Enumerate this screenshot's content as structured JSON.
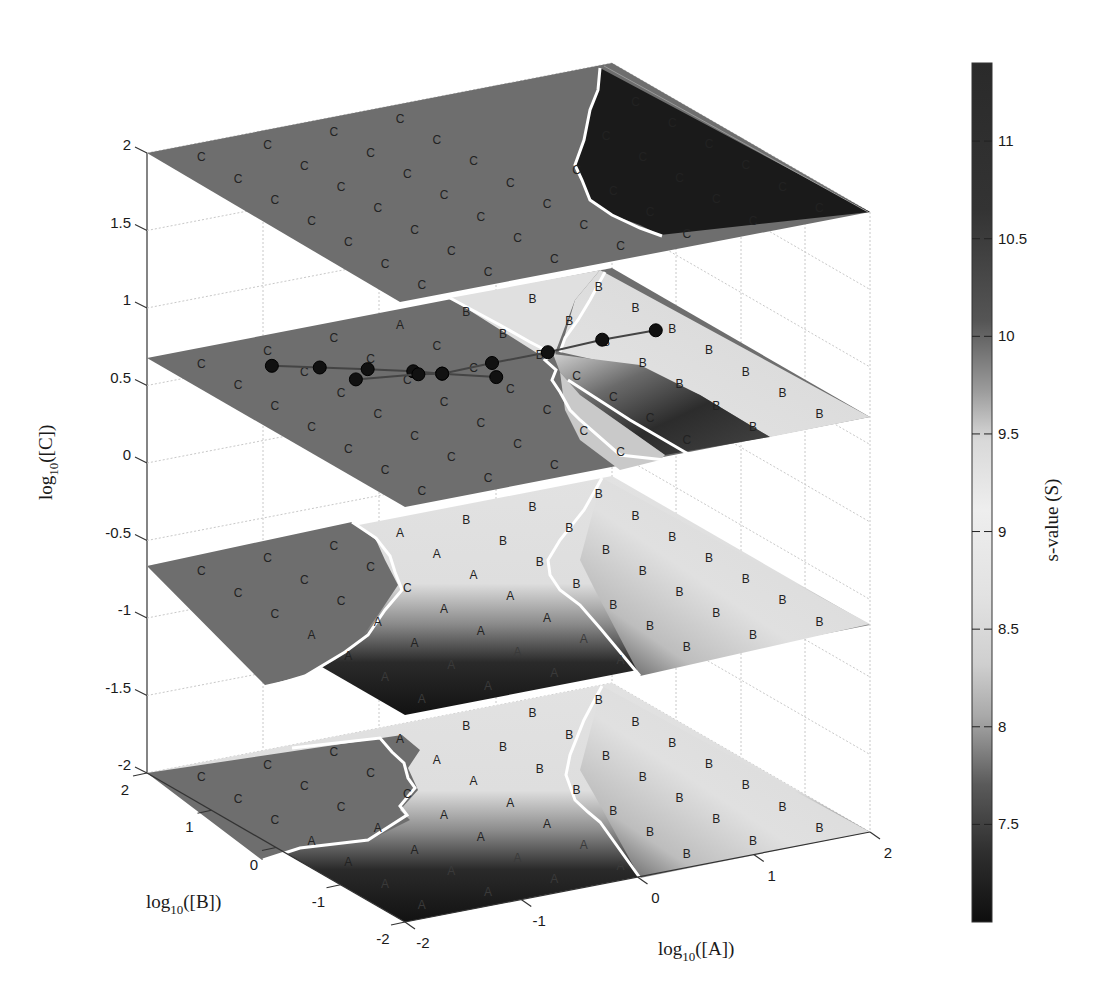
{
  "chart_data": {
    "type": "heatmap",
    "subtype": "3d-stacked-slices",
    "title": "",
    "xlabel": "log10([A])",
    "ylabel": "log10([B])",
    "zlabel": "log10([C])",
    "colorbar_label": "s-value (S)",
    "x_ticks": [
      "-2",
      "-1",
      "0",
      "1",
      "2"
    ],
    "y_ticks": [
      "-2",
      "-1",
      "0",
      "1",
      "2"
    ],
    "z_ticks": [
      "-2",
      "-1.5",
      "-1",
      "-0.5",
      "0",
      "0.5",
      "1",
      "1.5",
      "2"
    ],
    "colorbar_ticks": [
      "7.5",
      "8",
      "8.5",
      "9",
      "9.5",
      "10",
      "10.5",
      "11"
    ],
    "colorbar_range": [
      7.0,
      11.4
    ],
    "xlim": [
      -2,
      2
    ],
    "ylim": [
      -2,
      2
    ],
    "zlim": [
      -2,
      2
    ],
    "slices_z": [
      2,
      0.67,
      -0.67,
      -2
    ],
    "region_labels": [
      "A",
      "B",
      "C"
    ],
    "slices": [
      {
        "z": 2,
        "regions": {
          "C": "most of plane (s≈10.4, mid-gray)",
          "A": "dark corner at high [A], high [B] (s≈11)"
        }
      },
      {
        "z": 0.67,
        "regions": {
          "C": "left half (mid-gray)",
          "A": "light band near back",
          "B": "right side (light, s≈9.5)",
          "C_dark": "dark strip near A≈0..1"
        }
      },
      {
        "z": -0.67,
        "regions": {
          "C": "left (mid-gray)",
          "A": "center wedge, light to dark toward front",
          "B": "right (light)"
        }
      },
      {
        "z": -2,
        "regions": {
          "C": "left (mid-gray)",
          "A": "center wedge, light to dark toward front",
          "B": "right (light)"
        }
      }
    ],
    "trajectory": {
      "z": 0.67,
      "chains": [
        [
          [
            -1.27,
            1.38
          ],
          [
            -0.98,
            1.16
          ],
          [
            -0.69,
            0.94
          ],
          [
            -0.42,
            0.72
          ],
          [
            -0.26,
            0.56
          ],
          [
            0.05,
            0.28
          ]
        ],
        [
          [
            -0.88,
            0.78
          ],
          [
            -0.42,
            0.64
          ],
          [
            -0.26,
            0.56
          ],
          [
            0.18,
            0.58
          ],
          [
            0.66,
            0.58
          ],
          [
            1.15,
            0.62
          ],
          [
            1.6,
            0.6
          ]
        ]
      ]
    },
    "grid": true,
    "legend_position": "colorbar right"
  },
  "labels": {
    "xlabel_main": "log",
    "xlabel_sub": "10",
    "xlabel_arg": "([A])",
    "ylabel_main": "log",
    "ylabel_sub": "10",
    "ylabel_arg": "([B])",
    "zlabel_main": "log",
    "zlabel_sub": "10",
    "zlabel_arg": "([C])",
    "colorbar_label": "s-value (S)"
  },
  "ticks": {
    "z": [
      {
        "label": "2",
        "value": 2
      },
      {
        "label": "1.5",
        "value": 1.5
      },
      {
        "label": "1",
        "value": 1
      },
      {
        "label": "0.5",
        "value": 0.5
      },
      {
        "label": "0",
        "value": 0
      },
      {
        "label": "-0.5",
        "value": -0.5
      },
      {
        "label": "-1",
        "value": -1
      },
      {
        "label": "-1.5",
        "value": -1.5
      },
      {
        "label": "-2",
        "value": -2
      }
    ],
    "b": [
      {
        "label": "2",
        "value": 2
      },
      {
        "label": "1",
        "value": 1
      },
      {
        "label": "0",
        "value": 0
      },
      {
        "label": "-1",
        "value": -1
      },
      {
        "label": "-2",
        "value": -2
      }
    ],
    "a": [
      {
        "label": "-2",
        "value": -2
      },
      {
        "label": "-1",
        "value": -1
      },
      {
        "label": "0",
        "value": 0
      },
      {
        "label": "1",
        "value": 1
      },
      {
        "label": "2",
        "value": 2
      }
    ],
    "colorbar": [
      {
        "label": "11",
        "value": 11
      },
      {
        "label": "10.5",
        "value": 10.5
      },
      {
        "label": "10",
        "value": 10
      },
      {
        "label": "9.5",
        "value": 9.5
      },
      {
        "label": "9",
        "value": 9
      },
      {
        "label": "8.5",
        "value": 8.5
      },
      {
        "label": "8",
        "value": 8
      },
      {
        "label": "7.5",
        "value": 7.5
      }
    ]
  },
  "colors": {
    "region_C": "#6e6e6e",
    "region_dark": "#1c1c1c",
    "region_light": "#e6e6e6",
    "region_mid_light": "#cfcfcf",
    "boundary": "#ffffff",
    "marker": "#111111",
    "trajectory_line": "#444444"
  }
}
